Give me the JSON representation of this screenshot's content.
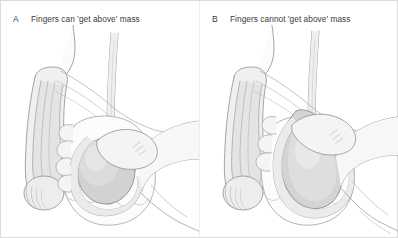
{
  "figure": {
    "background_color": "#ffffff",
    "border_color": "#dcdcdc",
    "line_color": "#8d8d8d",
    "shade_light": "#ededed",
    "shade_mid": "#dcdcdc",
    "shade_dark": "#c4c4c4",
    "text_color": "#3a3a3a"
  },
  "panels": [
    {
      "letter": "A",
      "caption": "Fingers can 'get above' mass",
      "illustration_name": "scrotal-exam-fingers-above"
    },
    {
      "letter": "B",
      "caption": "Fingers cannot 'get above' mass",
      "illustration_name": "scrotal-exam-fingers-not-above"
    }
  ]
}
